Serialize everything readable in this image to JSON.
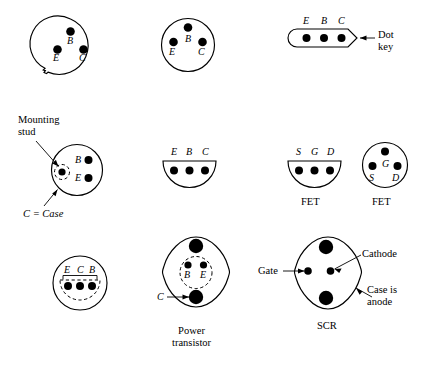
{
  "figure": {
    "title_text": "",
    "background_color": "#ffffff",
    "ink_color": "#000000"
  },
  "devices": [
    {
      "id": "to5-tab-npn",
      "shape": "circle-with-locating-tab",
      "pins": [
        {
          "label": "B",
          "position": "top-center"
        },
        {
          "label": "E",
          "position": "lower-left"
        },
        {
          "label": "C",
          "position": "lower-right"
        }
      ]
    },
    {
      "id": "to5-plain-npn",
      "shape": "circle",
      "pins": [
        {
          "label": "B",
          "position": "top-center"
        },
        {
          "label": "E",
          "position": "lower-left"
        },
        {
          "label": "C",
          "position": "lower-right"
        }
      ]
    },
    {
      "id": "inline-dot-key",
      "shape": "rounded-bar-with-pointed-end",
      "pins": [
        {
          "label": "E",
          "position": "left"
        },
        {
          "label": "B",
          "position": "center"
        },
        {
          "label": "C",
          "position": "right"
        }
      ],
      "callout": "Dot\nkey"
    },
    {
      "id": "stud-mount-transistor",
      "shape": "circle",
      "pins": [
        {
          "label": "B",
          "position": "right-upper"
        },
        {
          "label": "E",
          "position": "right-lower"
        }
      ],
      "callouts": [
        "Mounting\nstud",
        "C = Case"
      ]
    },
    {
      "id": "d-package-transistor",
      "shape": "half-circle-flat-top",
      "pins": [
        {
          "label": "E",
          "position": "left"
        },
        {
          "label": "B",
          "position": "center"
        },
        {
          "label": "C",
          "position": "right"
        }
      ]
    },
    {
      "id": "fet-d-package",
      "shape": "half-circle-flat-top",
      "pins": [
        {
          "label": "S",
          "position": "left"
        },
        {
          "label": "G",
          "position": "center"
        },
        {
          "label": "D",
          "position": "right"
        }
      ],
      "name": "FET"
    },
    {
      "id": "fet-round-package",
      "shape": "circle",
      "pins": [
        {
          "label": "G",
          "position": "top-center"
        },
        {
          "label": "S",
          "position": "lower-left"
        },
        {
          "label": "D",
          "position": "lower-right"
        }
      ],
      "name": "FET"
    },
    {
      "id": "round-inline-three-pin",
      "shape": "circle-with-inner-dashed-d",
      "pins": [
        {
          "label": "E",
          "position": "left"
        },
        {
          "label": "C",
          "position": "center"
        },
        {
          "label": "B",
          "position": "right"
        }
      ]
    },
    {
      "id": "power-transistor",
      "shape": "diamond-oval-two-mounting-holes",
      "pins": [
        {
          "label": "B",
          "position": "inner-left"
        },
        {
          "label": "E",
          "position": "inner-right"
        },
        {
          "label": "C",
          "position": "bottom-mounting-hole"
        }
      ],
      "name": "Power\ntransistor"
    },
    {
      "id": "scr",
      "shape": "diamond-oval-two-mounting-holes",
      "pins": [
        {
          "label": "Gate",
          "position": "inner-left"
        },
        {
          "label": "Cathode",
          "position": "inner-right"
        }
      ],
      "callout": "Case is\nanode",
      "name": "SCR"
    }
  ],
  "labels": {
    "d1_B": "B",
    "d1_E": "E",
    "d1_C": "C",
    "d2_B": "B",
    "d2_E": "E",
    "d2_C": "C",
    "d3_E": "E",
    "d3_B": "B",
    "d3_C": "C",
    "dot_key": "Dot\nkey",
    "mounting_stud": "Mounting\nstud",
    "d4_B": "B",
    "d4_E": "E",
    "c_equals_case": "C = Case",
    "d5_E": "E",
    "d5_B": "B",
    "d5_C": "C",
    "d6_S": "S",
    "d6_G": "G",
    "d6_D": "D",
    "fet_left": "FET",
    "d7_G": "G",
    "d7_S": "S",
    "d7_D": "D",
    "fet_right": "FET",
    "d8_E": "E",
    "d8_C": "C",
    "d8_B": "B",
    "d9_B": "B",
    "d9_E": "E",
    "d9_C": "C",
    "power_transistor": "Power\ntransistor",
    "gate": "Gate",
    "cathode": "Cathode",
    "case_is_anode": "Case is\nanode",
    "scr": "SCR"
  }
}
